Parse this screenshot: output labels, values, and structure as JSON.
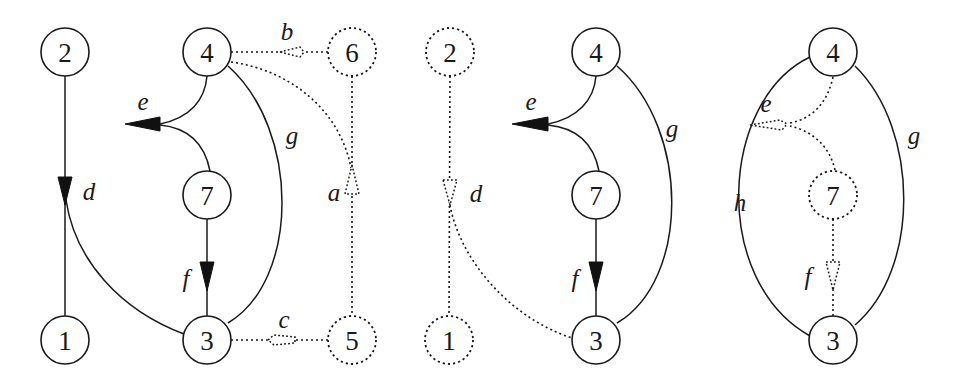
{
  "figure": {
    "panels": [
      {
        "id": "panel-1",
        "nodes": [
          {
            "id": "2",
            "label": "2",
            "style": "solid"
          },
          {
            "id": "1",
            "label": "1",
            "style": "solid"
          },
          {
            "id": "4",
            "label": "4",
            "style": "solid"
          },
          {
            "id": "7",
            "label": "7",
            "style": "solid"
          },
          {
            "id": "3",
            "label": "3",
            "style": "solid"
          },
          {
            "id": "6",
            "label": "6",
            "style": "dashed"
          },
          {
            "id": "5",
            "label": "5",
            "style": "dashed"
          }
        ],
        "edges": [
          {
            "label": "d",
            "from": "2",
            "to": "1/3",
            "style": "solid",
            "arrow": "filled"
          },
          {
            "label": "e",
            "from": "4,7",
            "to": "open",
            "style": "solid",
            "arrow": "filled"
          },
          {
            "label": "g",
            "from": "4",
            "to": "3",
            "style": "solid",
            "arrow": "none"
          },
          {
            "label": "f",
            "from": "7",
            "to": "3",
            "style": "solid",
            "arrow": "filled"
          },
          {
            "label": "b",
            "from": "6",
            "to": "4",
            "style": "dashed",
            "arrow": "hollow"
          },
          {
            "label": "a",
            "from": "5",
            "to": "4/6",
            "style": "dashed",
            "arrow": "hollow"
          },
          {
            "label": "c",
            "from": "5",
            "to": "3",
            "style": "dashed",
            "arrow": "hollow"
          }
        ]
      },
      {
        "id": "panel-2",
        "nodes": [
          {
            "id": "2",
            "label": "2",
            "style": "dashed"
          },
          {
            "id": "1",
            "label": "1",
            "style": "dashed"
          },
          {
            "id": "4",
            "label": "4",
            "style": "solid"
          },
          {
            "id": "7",
            "label": "7",
            "style": "solid"
          },
          {
            "id": "3",
            "label": "3",
            "style": "solid"
          }
        ],
        "edges": [
          {
            "label": "d",
            "from": "2",
            "to": "1/3",
            "style": "dashed",
            "arrow": "hollow"
          },
          {
            "label": "e",
            "from": "4,7",
            "to": "open",
            "style": "solid",
            "arrow": "filled"
          },
          {
            "label": "g",
            "from": "4",
            "to": "3",
            "style": "solid",
            "arrow": "none"
          },
          {
            "label": "f",
            "from": "7",
            "to": "3",
            "style": "solid",
            "arrow": "filled"
          }
        ]
      },
      {
        "id": "panel-3",
        "nodes": [
          {
            "id": "4",
            "label": "4",
            "style": "solid"
          },
          {
            "id": "7",
            "label": "7",
            "style": "dashed"
          },
          {
            "id": "3",
            "label": "3",
            "style": "solid"
          }
        ],
        "edges": [
          {
            "label": "e",
            "from": "4,7",
            "to": "h",
            "style": "dashed",
            "arrow": "hollow"
          },
          {
            "label": "g",
            "from": "4",
            "to": "3",
            "style": "solid",
            "arrow": "none"
          },
          {
            "label": "h",
            "from": "4",
            "to": "3",
            "style": "solid",
            "arrow": "none"
          },
          {
            "label": "f",
            "from": "7",
            "to": "3",
            "style": "dashed",
            "arrow": "hollow"
          }
        ]
      }
    ]
  }
}
